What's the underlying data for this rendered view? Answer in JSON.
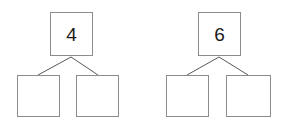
{
  "canvas": {
    "width": 289,
    "height": 124,
    "background": "#ffffff"
  },
  "style": {
    "box_border_color": "#8c8c8c",
    "connector_color": "#595959",
    "numeral_color": "#1a1a1a"
  },
  "diagrams": [
    {
      "id": "number-bond-1",
      "whole": {
        "value": "4",
        "empty": false,
        "x": 50,
        "y": 12,
        "width": 43,
        "height": 44
      },
      "parts": [
        {
          "value": "",
          "empty": true,
          "x": 17,
          "y": 75,
          "width": 43,
          "height": 42
        },
        {
          "value": "",
          "empty": true,
          "x": 76,
          "y": 75,
          "width": 43,
          "height": 42
        }
      ],
      "connectors": [
        {
          "x1": 71,
          "y1": 57,
          "x2": 38,
          "y2": 75
        },
        {
          "x1": 71,
          "y1": 57,
          "x2": 98,
          "y2": 75
        }
      ]
    },
    {
      "id": "number-bond-2",
      "whole": {
        "value": "6",
        "empty": false,
        "x": 198,
        "y": 12,
        "width": 43,
        "height": 44
      },
      "parts": [
        {
          "value": "",
          "empty": true,
          "x": 166,
          "y": 75,
          "width": 43,
          "height": 42
        },
        {
          "value": "",
          "empty": true,
          "x": 226,
          "y": 75,
          "width": 45,
          "height": 42
        }
      ],
      "connectors": [
        {
          "x1": 219,
          "y1": 57,
          "x2": 187,
          "y2": 75
        },
        {
          "x1": 219,
          "y1": 57,
          "x2": 248,
          "y2": 75
        }
      ]
    }
  ]
}
